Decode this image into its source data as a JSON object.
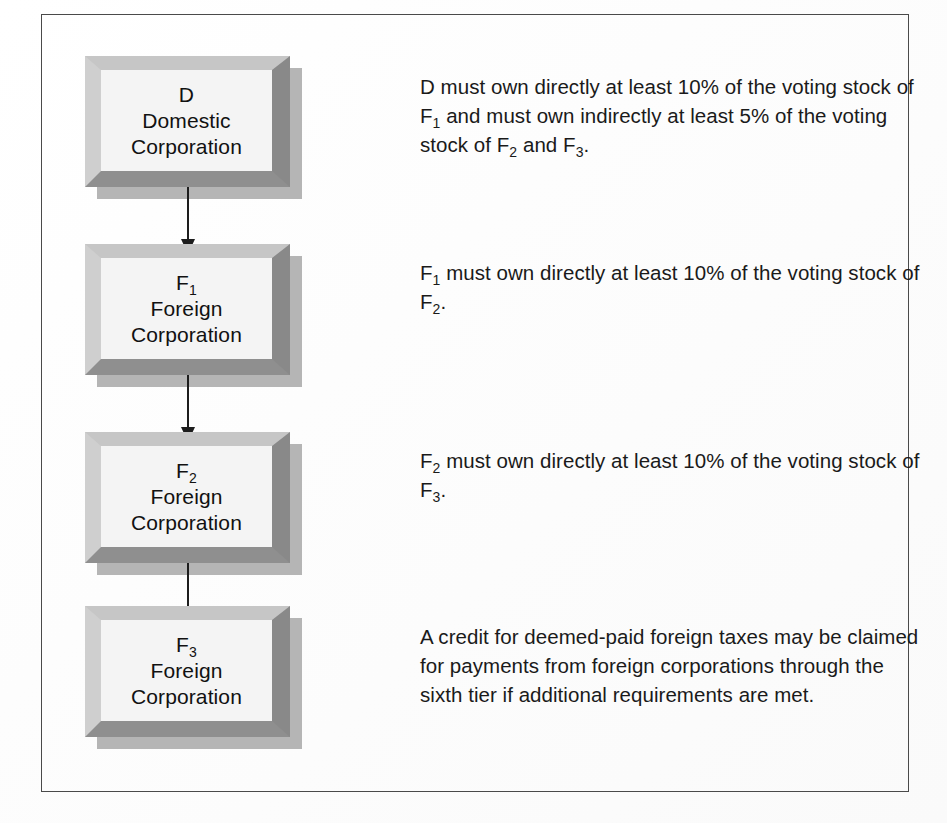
{
  "diagram": {
    "frame_border_color": "#4a4a4a",
    "background_color": "#ffffff",
    "box_face_color": "#f4f4f4",
    "box_bevel_light_color": "#c6c6c6",
    "box_bevel_dark_color": "#8f8f8f",
    "arrow_color": "#1d1d1d",
    "text_color": "#1a1a1a",
    "nodes": [
      {
        "id": "D",
        "label_main": "D",
        "label_sub": "",
        "line2": "Domestic",
        "line3": "Corporation"
      },
      {
        "id": "F1",
        "label_main": "F",
        "label_sub": "1",
        "line2": "Foreign",
        "line3": "Corporation"
      },
      {
        "id": "F2",
        "label_main": "F",
        "label_sub": "2",
        "line2": "Foreign",
        "line3": "Corporation"
      },
      {
        "id": "F3",
        "label_main": "F",
        "label_sub": "3",
        "line2": "Foreign",
        "line3": "Corporation"
      }
    ],
    "connectors": [
      {
        "from": "D",
        "to": "F1",
        "direction": "down"
      },
      {
        "from": "F1",
        "to": "F2",
        "direction": "down"
      },
      {
        "from": "F2",
        "to": "F3",
        "direction": "down"
      }
    ],
    "notes": [
      {
        "id": "note-d",
        "segments": [
          {
            "text": "D must own directly at least 10% of the voting stock of F"
          },
          {
            "sub": "1"
          },
          {
            "text": " and must own indirectly at least 5% of the voting stock of F"
          },
          {
            "sub": "2"
          },
          {
            "text": " and F"
          },
          {
            "sub": "3"
          },
          {
            "text": "."
          }
        ]
      },
      {
        "id": "note-f1",
        "segments": [
          {
            "text": "F"
          },
          {
            "sub": "1"
          },
          {
            "text": " must own directly at least 10% of the voting stock of F"
          },
          {
            "sub": "2"
          },
          {
            "text": "."
          }
        ]
      },
      {
        "id": "note-f2",
        "segments": [
          {
            "text": "F"
          },
          {
            "sub": "2"
          },
          {
            "text": " must own directly at least 10% of the voting stock of F"
          },
          {
            "sub": "3"
          },
          {
            "text": "."
          }
        ]
      },
      {
        "id": "note-f3",
        "segments": [
          {
            "text": "A credit for deemed-paid foreign taxes may be claimed for payments from foreign corporations through the sixth tier if additional requirements are met."
          }
        ]
      }
    ]
  }
}
